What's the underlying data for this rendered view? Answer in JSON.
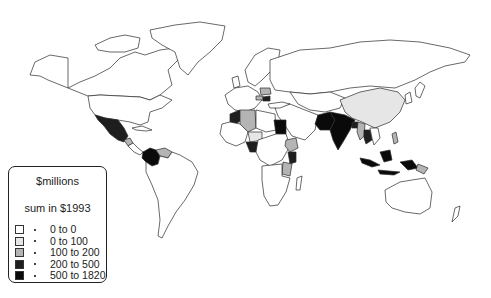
{
  "legend": {
    "title": "$millions",
    "subtitle": "sum in $1993",
    "items": [
      {
        "label": "0 to 0",
        "color": "#ffffff"
      },
      {
        "label": "0 to 100",
        "color": "#e6e6e6"
      },
      {
        "label": "100 to 200",
        "color": "#b4b4b4"
      },
      {
        "label": "200 to 500",
        "color": "#1e1e1e"
      },
      {
        "label": "500 to 1820",
        "color": "#0a0a0a"
      }
    ]
  },
  "map": {
    "type": "choropleth",
    "projection": "world",
    "shaded_regions": [
      {
        "region": "Mexico",
        "class": "200 to 500"
      },
      {
        "region": "Guatemala",
        "class": "100 to 200"
      },
      {
        "region": "Colombia",
        "class": "500 to 1820"
      },
      {
        "region": "Venezuela",
        "class": "100 to 200"
      },
      {
        "region": "Morocco",
        "class": "200 to 500"
      },
      {
        "region": "Algeria",
        "class": "100 to 200"
      },
      {
        "region": "Niger",
        "class": "0 to 100"
      },
      {
        "region": "Nigeria",
        "class": "200 to 500"
      },
      {
        "region": "Egypt",
        "class": "500 to 1820"
      },
      {
        "region": "Ethiopia",
        "class": "100 to 200"
      },
      {
        "region": "Kenya",
        "class": "200 to 500"
      },
      {
        "region": "Tanzania",
        "class": "100 to 200"
      },
      {
        "region": "Poland",
        "class": "100 to 200"
      },
      {
        "region": "Czech Republic",
        "class": "100 to 200"
      },
      {
        "region": "Slovakia/Hungary",
        "class": "200 to 500"
      },
      {
        "region": "Pakistan",
        "class": "500 to 1820"
      },
      {
        "region": "India",
        "class": "500 to 1820"
      },
      {
        "region": "Bangladesh",
        "class": "200 to 500"
      },
      {
        "region": "China",
        "class": "0 to 100"
      },
      {
        "region": "Myanmar",
        "class": "100 to 200"
      },
      {
        "region": "Thailand",
        "class": "200 to 500"
      },
      {
        "region": "Indonesia",
        "class": "500 to 1820"
      },
      {
        "region": "Papua New Guinea",
        "class": "100 to 200"
      },
      {
        "region": "Philippines",
        "class": "100 to 200"
      }
    ]
  }
}
